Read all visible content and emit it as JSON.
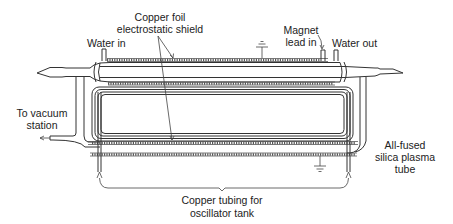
{
  "figure": {
    "type": "schematic",
    "colors": {
      "line": "#333333",
      "background": "#ffffff",
      "text": "#222222"
    }
  },
  "labels": {
    "shield_line1": "Copper foil",
    "shield_line2": "electrostatic shield",
    "water_in": "Water in",
    "magnet_line1": "Magnet",
    "magnet_line2": "lead in",
    "water_out": "Water out",
    "vacuum_line1": "To vacuum",
    "vacuum_line2": "station",
    "tube_line1": "All-fused",
    "tube_line2": "silica plasma",
    "tube_line3": "tube",
    "tubing_line1": "Copper tubing for",
    "tubing_line2": "oscillator tank"
  },
  "symbols": [
    {
      "name": "ground-symbol-top",
      "position": "top shield"
    },
    {
      "name": "ground-symbol-bottom",
      "position": "bottom shield"
    }
  ]
}
